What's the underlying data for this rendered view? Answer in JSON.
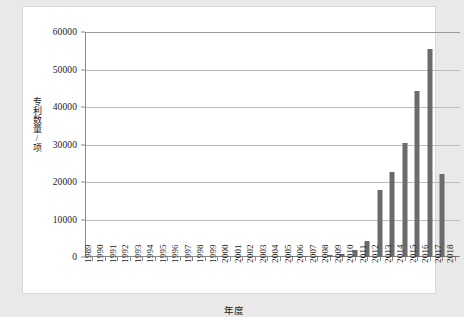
{
  "figure": {
    "background_color": "#e9e9e9",
    "panel_color": "#ffffff",
    "bar_color": "#6b6b6b",
    "grid_color": "#bdbdbd",
    "axis_color": "#8a8a8a"
  },
  "axes": {
    "y_title": "专利数量/项",
    "x_title": "年度",
    "y_ticks": [
      "0",
      "10000",
      "20000",
      "30000",
      "40000",
      "50000",
      "60000"
    ]
  },
  "chart_data": {
    "type": "bar",
    "title": "",
    "subtitle": "",
    "xlabel": "年度",
    "ylabel": "专利数量/项",
    "categories": [
      "1989",
      "1990",
      "1991",
      "1992",
      "1993",
      "1994",
      "1995",
      "1996",
      "1997",
      "1998",
      "1999",
      "2000",
      "2001",
      "2002",
      "2003",
      "2004",
      "2005",
      "2006",
      "2007",
      "2008",
      "2009",
      "2010",
      "2011",
      "2012",
      "2013",
      "2014",
      "2015",
      "2016",
      "2017",
      "2018"
    ],
    "values": [
      0,
      0,
      0,
      0,
      0,
      0,
      0,
      0,
      0,
      0,
      0,
      0,
      0,
      0,
      0,
      0,
      120,
      180,
      250,
      600,
      900,
      2000,
      4200,
      18000,
      22800,
      30400,
      44300,
      55500,
      22200,
      300
    ],
    "ylim": [
      0,
      60000
    ],
    "yticks": [
      0,
      10000,
      20000,
      30000,
      40000,
      50000,
      60000
    ],
    "grid": true,
    "grid_axis": "y",
    "legend": false,
    "legend_position": "none",
    "series": [
      {
        "name": "专利数量",
        "color": "#6b6b6b",
        "values": [
          0,
          0,
          0,
          0,
          0,
          0,
          0,
          0,
          0,
          0,
          0,
          0,
          0,
          0,
          0,
          0,
          120,
          180,
          250,
          600,
          900,
          2000,
          4200,
          18000,
          22800,
          30400,
          44300,
          55500,
          22200,
          300
        ]
      }
    ]
  }
}
